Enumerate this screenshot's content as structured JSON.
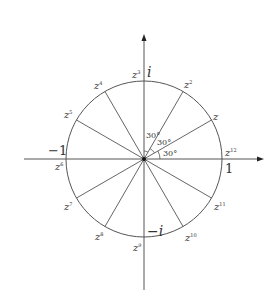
{
  "diagram": {
    "title": "",
    "axes": {
      "positive_real_label": "1",
      "negative_real_label": "−1",
      "positive_imag_label": "i",
      "negative_imag_label": "−i"
    },
    "angles": [
      "30°",
      "30°",
      "30°"
    ],
    "roots": [
      {
        "base": "z",
        "exp": "",
        "angle_deg": 30
      },
      {
        "base": "z",
        "exp": "2",
        "angle_deg": 60
      },
      {
        "base": "z",
        "exp": "3",
        "angle_deg": 90
      },
      {
        "base": "z",
        "exp": "4",
        "angle_deg": 120
      },
      {
        "base": "z",
        "exp": "5",
        "angle_deg": 150
      },
      {
        "base": "z",
        "exp": "6",
        "angle_deg": 180
      },
      {
        "base": "z",
        "exp": "7",
        "angle_deg": 210
      },
      {
        "base": "z",
        "exp": "8",
        "angle_deg": 240
      },
      {
        "base": "z",
        "exp": "9",
        "angle_deg": 270
      },
      {
        "base": "z",
        "exp": "10",
        "angle_deg": 300
      },
      {
        "base": "z",
        "exp": "11",
        "angle_deg": 330
      },
      {
        "base": "z",
        "exp": "12",
        "angle_deg": 0
      }
    ],
    "colors": {
      "stroke": "#555555",
      "text": "#333333",
      "background": "#ffffff"
    }
  }
}
